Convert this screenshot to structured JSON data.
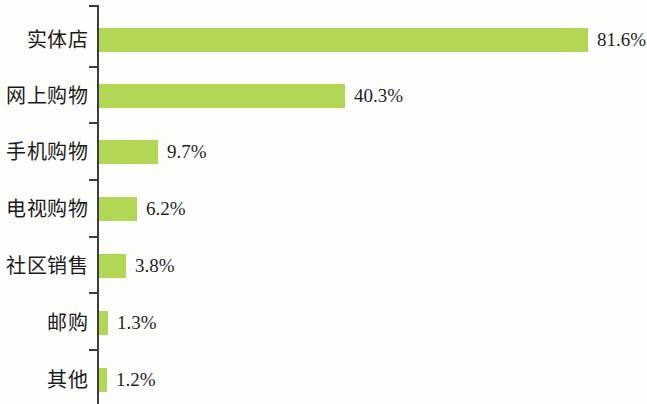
{
  "chart_data": {
    "type": "bar",
    "orientation": "horizontal",
    "title": "",
    "subtitle": "",
    "xlabel": "",
    "ylabel": "",
    "grid": false,
    "legend": "none",
    "xlim": [
      0,
      81.6
    ],
    "categories": [
      "实体店",
      "网上购物",
      "手机购物",
      "电视购物",
      "社区销售",
      "邮购",
      "其他"
    ],
    "values": [
      81.6,
      40.3,
      9.7,
      6.2,
      3.8,
      1.3,
      1.2
    ],
    "value_labels": [
      "81.6%",
      "40.3%",
      "9.7%",
      "6.2%",
      "3.8%",
      "1.3%",
      "1.2%"
    ],
    "bar_color": "#b2d755",
    "axis_color": "#3d3d3d",
    "text_color": "#1b1b1b"
  },
  "bars": [
    {
      "category": "实体店",
      "value": 81.6,
      "label": "81.6%",
      "bar_px": 489,
      "top_px": 28
    },
    {
      "category": "网上购物",
      "value": 40.3,
      "label": "40.3%",
      "bar_px": 246,
      "top_px": 84
    },
    {
      "category": "手机购物",
      "value": 9.7,
      "label": "9.7%",
      "bar_px": 59,
      "top_px": 140
    },
    {
      "category": "电视购物",
      "value": 6.2,
      "label": "6.2%",
      "bar_px": 38,
      "top_px": 197
    },
    {
      "category": "社区销售",
      "value": 3.8,
      "label": "3.8%",
      "bar_px": 27,
      "top_px": 254
    },
    {
      "category": "邮购",
      "value": 1.3,
      "label": "1.3%",
      "bar_px": 9,
      "top_px": 311
    },
    {
      "category": "其他",
      "value": 1.2,
      "label": "1.2%",
      "bar_px": 8,
      "top_px": 368
    }
  ],
  "axis": {
    "ticks_top_px": [
      5,
      66,
      122,
      179,
      236,
      292,
      349
    ]
  }
}
